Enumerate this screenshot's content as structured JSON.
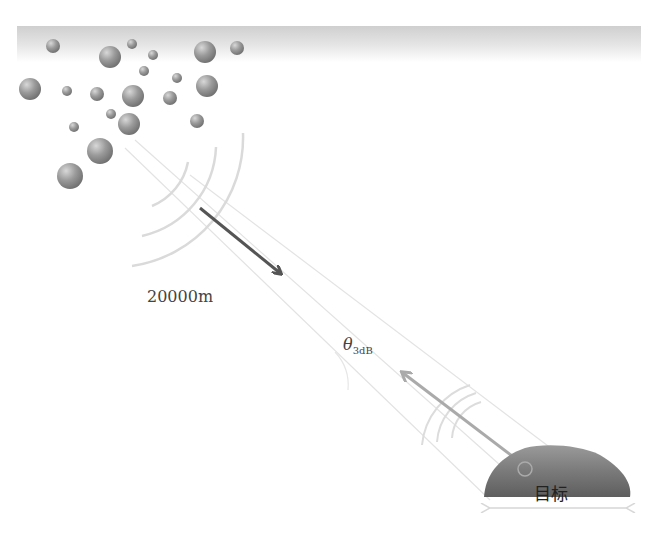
{
  "diagram": {
    "labels": {
      "range": "20000m",
      "beamwidth_symbol": "θ",
      "beamwidth_subscript": "3dB",
      "target": "目标"
    },
    "colors": {
      "cloud_band": "#cfcfcf",
      "droplet": "#8a8a8a",
      "tx_arrow": "#555555",
      "rx_arrow": "#a8a8a8",
      "wave_arcs": "#dcdcdc",
      "beam_lines": "#e6e6e6",
      "target_dome": "#7a7a7a"
    },
    "elements": {
      "cloud_layer": "cloud droplets / rain particles",
      "transmit_wave": "radar waves from satellite-borne side",
      "receive_wave": "echo waves from target",
      "beam_cone": "3dB beamwidth cone",
      "target_extent": "double-headed arrow under target"
    }
  }
}
